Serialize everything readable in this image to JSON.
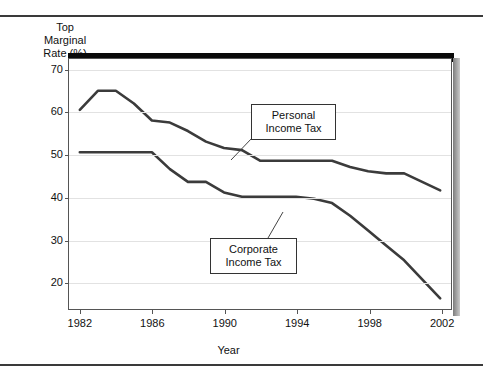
{
  "figure": {
    "y_axis_title": [
      "Top",
      "Marginal",
      "Rate (%)"
    ],
    "x_axis_title": "Year"
  },
  "callouts": {
    "personal": [
      "Personal",
      "Income Tax"
    ],
    "corporate": [
      "Corporate",
      "Income Tax"
    ]
  },
  "chart_data": {
    "type": "line",
    "title": "",
    "xlabel": "Year",
    "ylabel": "Top Marginal Rate (%)",
    "xlim": [
      1981.4,
      2002.6
    ],
    "ylim": [
      13.5,
      72.5
    ],
    "grid": true,
    "legend_position": "inline-callouts",
    "xticks": [
      1982,
      1986,
      1990,
      1994,
      1998,
      2002
    ],
    "yticks": [
      20,
      30,
      40,
      50,
      60,
      70
    ],
    "x": [
      1982,
      1983,
      1984,
      1985,
      1986,
      1987,
      1988,
      1989,
      1990,
      1991,
      1992,
      1993,
      1994,
      1995,
      1996,
      1997,
      1998,
      1999,
      2000,
      2001,
      2002
    ],
    "series": [
      {
        "name": "Personal Income Tax",
        "color": "#3b3b3b",
        "values": [
          60.5,
          65.0,
          65.0,
          62.0,
          58.0,
          57.5,
          55.5,
          53.0,
          51.5,
          51.0,
          48.5,
          48.5,
          48.5,
          48.5,
          48.5,
          47.0,
          46.0,
          45.5,
          45.5,
          43.5,
          41.5
        ]
      },
      {
        "name": "Corporate Income Tax",
        "color": "#3b3b3b",
        "values": [
          50.5,
          50.5,
          50.5,
          50.5,
          50.5,
          46.5,
          43.5,
          43.5,
          41.0,
          40.0,
          40.0,
          40.0,
          40.0,
          39.5,
          38.5,
          35.5,
          32.0,
          28.5,
          25.0,
          20.5,
          16.0
        ]
      }
    ]
  }
}
